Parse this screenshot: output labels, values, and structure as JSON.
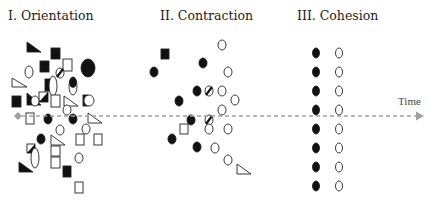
{
  "phases": [
    {
      "label": "I. Orientation",
      "x": 8
    },
    {
      "label": "II. Contraction",
      "x": 160
    },
    {
      "label": "III. Cohesion",
      "x": 297
    }
  ],
  "axis": {
    "label": "Time",
    "y": 116,
    "x_start": 18,
    "x_end": 424,
    "color": "#a0a0a0",
    "label_x": 398,
    "label_y": 95
  },
  "colors": {
    "ink": "#111111",
    "stroke": "#222222",
    "axis": "#a0a0a0"
  },
  "shapes": [
    {
      "t": "tri",
      "fill": "black",
      "x": 27,
      "y": 42,
      "w": 14,
      "h": 10
    },
    {
      "t": "sq",
      "fill": "black",
      "x": 51,
      "y": 48,
      "w": 9,
      "h": 11
    },
    {
      "t": "sq",
      "fill": "black",
      "x": 40,
      "y": 61,
      "w": 9,
      "h": 11
    },
    {
      "t": "sq",
      "fill": "white",
      "x": 63,
      "y": 59,
      "w": 9,
      "h": 12
    },
    {
      "t": "ell",
      "fill": "black",
      "x": 88,
      "y": 68,
      "rx": 7,
      "ry": 9
    },
    {
      "t": "ell",
      "fill": "white",
      "x": 29,
      "y": 72,
      "rx": 4,
      "ry": 6
    },
    {
      "t": "halfcirc",
      "x": 60,
      "y": 73,
      "r": 4
    },
    {
      "t": "tri",
      "fill": "white",
      "x": 12,
      "y": 78,
      "w": 15,
      "h": 9
    },
    {
      "t": "sq",
      "fill": "black",
      "x": 45,
      "y": 79,
      "w": 9,
      "h": 12
    },
    {
      "t": "ell",
      "fill": "white",
      "x": 53,
      "y": 86,
      "rx": 4,
      "ry": 10
    },
    {
      "t": "pill",
      "x": 73,
      "y": 86,
      "rx": 4,
      "ry": 9
    },
    {
      "t": "sq",
      "fill": "black",
      "x": 12,
      "y": 96,
      "w": 9,
      "h": 11
    },
    {
      "t": "tri",
      "fill": "black",
      "x": 27,
      "y": 93,
      "w": 14,
      "h": 12
    },
    {
      "t": "halfsq",
      "x": 39,
      "y": 92,
      "w": 9,
      "h": 10
    },
    {
      "t": "ell",
      "fill": "white",
      "x": 35,
      "y": 101,
      "rx": 4,
      "ry": 5
    },
    {
      "t": "sq",
      "fill": "white",
      "x": 51,
      "y": 95,
      "w": 9,
      "h": 12
    },
    {
      "t": "tri",
      "fill": "white",
      "x": 64,
      "y": 96,
      "w": 14,
      "h": 10
    },
    {
      "t": "ell",
      "fill": "white",
      "x": 67,
      "y": 110,
      "rx": 4,
      "ry": 5
    },
    {
      "t": "halfsqv",
      "x": 83,
      "y": 95,
      "w": 10,
      "h": 11
    },
    {
      "t": "sq",
      "fill": "white",
      "x": 26,
      "y": 113,
      "w": 8,
      "h": 11
    },
    {
      "t": "ell",
      "fill": "black",
      "x": 48,
      "y": 119,
      "rx": 4,
      "ry": 5
    },
    {
      "t": "ell",
      "fill": "black",
      "x": 73,
      "y": 119,
      "rx": 4,
      "ry": 5
    },
    {
      "t": "tri",
      "fill": "white",
      "x": 88,
      "y": 113,
      "w": 14,
      "h": 10
    },
    {
      "t": "ell",
      "fill": "white",
      "x": 60,
      "y": 130,
      "rx": 4,
      "ry": 5
    },
    {
      "t": "ell",
      "fill": "white",
      "x": 86,
      "y": 129,
      "rx": 4,
      "ry": 5
    },
    {
      "t": "ell",
      "fill": "black",
      "x": 41,
      "y": 139,
      "rx": 4,
      "ry": 5
    },
    {
      "t": "tri",
      "fill": "white",
      "x": 51,
      "y": 135,
      "w": 14,
      "h": 10
    },
    {
      "t": "sq",
      "fill": "white",
      "x": 76,
      "y": 134,
      "w": 8,
      "h": 11
    },
    {
      "t": "sq",
      "fill": "white",
      "x": 94,
      "y": 134,
      "w": 8,
      "h": 11
    },
    {
      "t": "halfsq",
      "x": 27,
      "y": 144,
      "w": 8,
      "h": 9
    },
    {
      "t": "sq",
      "fill": "white",
      "x": 51,
      "y": 146,
      "w": 9,
      "h": 10
    },
    {
      "t": "sq",
      "fill": "white",
      "x": 51,
      "y": 157,
      "w": 9,
      "h": 11
    },
    {
      "t": "ell",
      "fill": "white",
      "x": 35,
      "y": 158,
      "rx": 4,
      "ry": 10
    },
    {
      "t": "ell",
      "fill": "white",
      "x": 79,
      "y": 158,
      "rx": 4,
      "ry": 5
    },
    {
      "t": "tri",
      "fill": "black",
      "x": 19,
      "y": 162,
      "w": 14,
      "h": 10
    },
    {
      "t": "sq",
      "fill": "black",
      "x": 63,
      "y": 166,
      "w": 8,
      "h": 11
    },
    {
      "t": "sq",
      "fill": "white",
      "x": 75,
      "y": 182,
      "w": 8,
      "h": 11
    },
    {
      "t": "ell",
      "fill": "white",
      "x": 222,
      "y": 45,
      "rx": 4,
      "ry": 5
    },
    {
      "t": "sq",
      "fill": "black",
      "x": 161,
      "y": 49,
      "w": 8,
      "h": 10
    },
    {
      "t": "ell",
      "fill": "black",
      "x": 203,
      "y": 63,
      "rx": 4,
      "ry": 5
    },
    {
      "t": "ell",
      "fill": "black",
      "x": 154,
      "y": 72,
      "rx": 4,
      "ry": 5
    },
    {
      "t": "ell",
      "fill": "white",
      "x": 228,
      "y": 72,
      "rx": 4,
      "ry": 5
    },
    {
      "t": "ell",
      "fill": "black",
      "x": 197,
      "y": 91,
      "rx": 4,
      "ry": 5
    },
    {
      "t": "hatchcirc",
      "x": 209,
      "y": 91,
      "r": 4
    },
    {
      "t": "ell",
      "fill": "white",
      "x": 222,
      "y": 91,
      "rx": 4,
      "ry": 5
    },
    {
      "t": "ell",
      "fill": "black",
      "x": 179,
      "y": 101,
      "rx": 4,
      "ry": 5
    },
    {
      "t": "ell",
      "fill": "white",
      "x": 235,
      "y": 100,
      "rx": 4,
      "ry": 5
    },
    {
      "t": "ell",
      "fill": "white",
      "x": 222,
      "y": 110,
      "rx": 4,
      "ry": 5
    },
    {
      "t": "ell",
      "fill": "black",
      "x": 191,
      "y": 120,
      "rx": 4,
      "ry": 5
    },
    {
      "t": "hatchcirc",
      "x": 209,
      "y": 120,
      "r": 4
    },
    {
      "t": "sq",
      "fill": "white",
      "x": 180,
      "y": 124,
      "w": 8,
      "h": 10
    },
    {
      "t": "ell",
      "fill": "white",
      "x": 209,
      "y": 129,
      "rx": 4,
      "ry": 5
    },
    {
      "t": "ell",
      "fill": "white",
      "x": 228,
      "y": 129,
      "rx": 4,
      "ry": 5
    },
    {
      "t": "ell",
      "fill": "black",
      "x": 172,
      "y": 139,
      "rx": 4,
      "ry": 5
    },
    {
      "t": "ell",
      "fill": "black",
      "x": 197,
      "y": 147,
      "rx": 4,
      "ry": 5
    },
    {
      "t": "ell",
      "fill": "white",
      "x": 215,
      "y": 148,
      "rx": 4,
      "ry": 5
    },
    {
      "t": "ell",
      "fill": "white",
      "x": 228,
      "y": 160,
      "rx": 4,
      "ry": 5
    },
    {
      "t": "tri",
      "fill": "white",
      "x": 237,
      "y": 164,
      "w": 14,
      "h": 10
    },
    {
      "t": "ell",
      "fill": "black",
      "x": 316,
      "y": 53,
      "rx": 3.5,
      "ry": 5
    },
    {
      "t": "ell",
      "fill": "white",
      "x": 339,
      "y": 53,
      "rx": 3.5,
      "ry": 5
    },
    {
      "t": "ell",
      "fill": "black",
      "x": 316,
      "y": 72,
      "rx": 3.5,
      "ry": 5
    },
    {
      "t": "ell",
      "fill": "white",
      "x": 339,
      "y": 72,
      "rx": 3.5,
      "ry": 5
    },
    {
      "t": "ell",
      "fill": "black",
      "x": 316,
      "y": 91,
      "rx": 3.5,
      "ry": 5
    },
    {
      "t": "ell",
      "fill": "white",
      "x": 339,
      "y": 91,
      "rx": 3.5,
      "ry": 5
    },
    {
      "t": "ell",
      "fill": "black",
      "x": 316,
      "y": 110,
      "rx": 3.5,
      "ry": 5
    },
    {
      "t": "ell",
      "fill": "white",
      "x": 339,
      "y": 110,
      "rx": 3.5,
      "ry": 5
    },
    {
      "t": "ell",
      "fill": "black",
      "x": 316,
      "y": 129,
      "rx": 3.5,
      "ry": 5
    },
    {
      "t": "ell",
      "fill": "white",
      "x": 339,
      "y": 129,
      "rx": 3.5,
      "ry": 5
    },
    {
      "t": "ell",
      "fill": "black",
      "x": 316,
      "y": 148,
      "rx": 3.5,
      "ry": 5
    },
    {
      "t": "ell",
      "fill": "white",
      "x": 339,
      "y": 148,
      "rx": 3.5,
      "ry": 5
    },
    {
      "t": "ell",
      "fill": "black",
      "x": 316,
      "y": 167,
      "rx": 3.5,
      "ry": 5
    },
    {
      "t": "ell",
      "fill": "white",
      "x": 339,
      "y": 167,
      "rx": 3.5,
      "ry": 5
    },
    {
      "t": "ell",
      "fill": "black",
      "x": 316,
      "y": 186,
      "rx": 3.5,
      "ry": 5
    },
    {
      "t": "ell",
      "fill": "white",
      "x": 339,
      "y": 186,
      "rx": 3.5,
      "ry": 5
    }
  ]
}
